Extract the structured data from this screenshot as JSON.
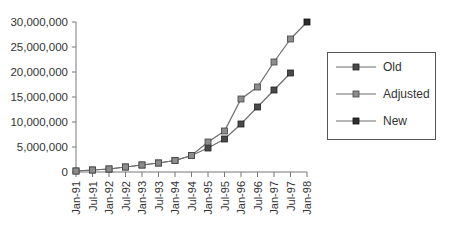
{
  "chart_data": {
    "type": "line",
    "title": "",
    "xlabel": "",
    "ylabel": "",
    "ylim": [
      0,
      30000000
    ],
    "yticks": [
      0,
      5000000,
      10000000,
      15000000,
      20000000,
      25000000,
      30000000
    ],
    "ytick_labels": [
      "0",
      "5,000,000",
      "10,000,000",
      "15,000,000",
      "20,000,000",
      "25,000,000",
      "30,000,000"
    ],
    "grid": false,
    "legend_position": "right",
    "categories": [
      "Jan-91",
      "Jul-91",
      "Jan-92",
      "Jul-92",
      "Jan-93",
      "Jul-93",
      "Jan-94",
      "Jul-94",
      "Jan-95",
      "Jul-95",
      "Jan-96",
      "Jul-96",
      "Jan-97",
      "Jul-97",
      "Jan-98"
    ],
    "series": [
      {
        "name": "Old",
        "color": "#444444",
        "values": [
          200000,
          400000,
          600000,
          1000000,
          1400000,
          1800000,
          2300000,
          3300000,
          4800000,
          6600000,
          9600000,
          13000000,
          16400000,
          19800000,
          null
        ]
      },
      {
        "name": "Adjusted",
        "color": "#7a7a7a",
        "values": [
          200000,
          400000,
          600000,
          1000000,
          1400000,
          1800000,
          2300000,
          3300000,
          6000000,
          8200000,
          14600000,
          17000000,
          22000000,
          26600000,
          null
        ]
      },
      {
        "name": "New",
        "color": "#2e2e2e",
        "values": [
          null,
          null,
          null,
          null,
          null,
          null,
          null,
          null,
          null,
          null,
          null,
          null,
          null,
          26600000,
          30000000
        ]
      }
    ]
  }
}
